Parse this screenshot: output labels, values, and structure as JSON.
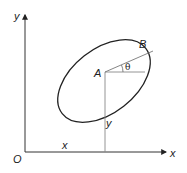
{
  "diagram": {
    "type": "geometry",
    "colors": {
      "stroke": "#222222",
      "guide": "#888888",
      "background": "#ffffff"
    },
    "axes": {
      "origin_label": "O",
      "x_axis_label": "x",
      "y_axis_label": "y"
    },
    "points": {
      "A": {
        "label": "A"
      },
      "B": {
        "label": "B"
      }
    },
    "dimensions": {
      "x_coordinate_label": "x",
      "y_coordinate_label": "y",
      "angle_label": "θ"
    },
    "shapes": [
      {
        "name": "body-outline",
        "kind": "ellipse",
        "tilt_deg": -35
      },
      {
        "name": "line-AB",
        "kind": "line",
        "from": "A",
        "to": "B"
      },
      {
        "name": "horizontal-reference",
        "kind": "line",
        "from": "A",
        "direction": "+x"
      },
      {
        "name": "vertical-drop",
        "kind": "line",
        "from": "A",
        "to": "x-axis"
      }
    ]
  }
}
